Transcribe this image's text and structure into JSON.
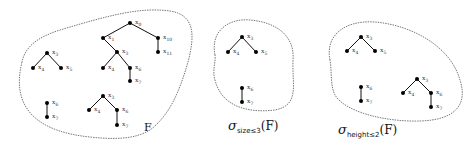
{
  "panels": [
    {
      "id": "F",
      "caption": "F",
      "blob": "M 22 62 C 10 110, 40 132, 90 137 C 125 141, 140 136, 150 130 C 170 115, 180 90, 188 62 C 195 35, 195 15, 170 11 C 140 7, 110 15, 60 30 C 35 38, 25 48, 22 62 Z",
      "caption_pos": [
        144,
        131
      ],
      "nodes": [
        {
          "id": "a0",
          "x": 130,
          "y": 23,
          "label": "x0"
        },
        {
          "id": "a1",
          "x": 103,
          "y": 38,
          "label": "x1"
        },
        {
          "id": "a10",
          "x": 158,
          "y": 38,
          "label": "x10"
        },
        {
          "id": "a11",
          "x": 158,
          "y": 52,
          "label": "x11"
        },
        {
          "id": "a3",
          "x": 117,
          "y": 52,
          "label": "x3"
        },
        {
          "id": "a4",
          "x": 103,
          "y": 68,
          "label": "x4"
        },
        {
          "id": "a6",
          "x": 130,
          "y": 68,
          "label": "x6"
        },
        {
          "id": "a7",
          "x": 130,
          "y": 81,
          "label": "x7"
        },
        {
          "id": "b3",
          "x": 47,
          "y": 53,
          "label": "x3"
        },
        {
          "id": "b4",
          "x": 33,
          "y": 68,
          "label": "x4"
        },
        {
          "id": "b5",
          "x": 61,
          "y": 68,
          "label": "x5"
        },
        {
          "id": "c6",
          "x": 47,
          "y": 103,
          "label": "x6"
        },
        {
          "id": "c7",
          "x": 47,
          "y": 117,
          "label": "x7"
        },
        {
          "id": "d3",
          "x": 103,
          "y": 96,
          "label": "x3"
        },
        {
          "id": "d4",
          "x": 89,
          "y": 110,
          "label": "x4"
        },
        {
          "id": "d6",
          "x": 117,
          "y": 110,
          "label": "x6"
        },
        {
          "id": "d7",
          "x": 117,
          "y": 125,
          "label": "x7"
        }
      ],
      "edges": [
        [
          "a0",
          "a1"
        ],
        [
          "a0",
          "a10"
        ],
        [
          "a10",
          "a11"
        ],
        [
          "a1",
          "a3"
        ],
        [
          "a3",
          "a4"
        ],
        [
          "a3",
          "a6"
        ],
        [
          "a6",
          "a7"
        ],
        [
          "b3",
          "b4"
        ],
        [
          "b3",
          "b5"
        ],
        [
          "c6",
          "c7"
        ],
        [
          "d3",
          "d4"
        ],
        [
          "d3",
          "d6"
        ],
        [
          "d6",
          "d7"
        ]
      ]
    },
    {
      "id": "size",
      "caption_main": "σ",
      "caption_sub": "size≤3",
      "caption_arg": "(F)",
      "blob": "M 215 55 C 210 30, 230 18, 250 20 C 275 22, 295 35, 293 60 C 292 85, 300 105, 275 110 C 250 113, 222 108, 215 80 C 212 70, 216 62, 215 55 Z",
      "caption_pos": [
        228,
        130
      ],
      "nodes": [
        {
          "id": "s3",
          "x": 242,
          "y": 37,
          "label": "x3"
        },
        {
          "id": "s4",
          "x": 228,
          "y": 52,
          "label": "x4"
        },
        {
          "id": "s5",
          "x": 256,
          "y": 52,
          "label": "x5"
        },
        {
          "id": "s6",
          "x": 242,
          "y": 88,
          "label": "x6"
        },
        {
          "id": "s7",
          "x": 242,
          "y": 102,
          "label": "x7"
        }
      ],
      "edges": [
        [
          "s3",
          "s4"
        ],
        [
          "s3",
          "s5"
        ],
        [
          "s6",
          "s7"
        ]
      ]
    },
    {
      "id": "height",
      "caption_main": "σ",
      "caption_sub": "height≤2",
      "caption_arg": "(F)",
      "blob": "M 330 60 C 325 35, 345 20, 375 22 C 410 25, 450 45, 460 80 C 468 105, 455 120, 420 121 C 385 122, 345 112, 335 95 C 330 85, 332 72, 330 60 Z",
      "caption_pos": [
        338,
        134
      ],
      "nodes": [
        {
          "id": "h3",
          "x": 361,
          "y": 37,
          "label": "x3"
        },
        {
          "id": "h4",
          "x": 347,
          "y": 51,
          "label": "x4"
        },
        {
          "id": "h5",
          "x": 375,
          "y": 51,
          "label": "x5"
        },
        {
          "id": "h6",
          "x": 361,
          "y": 87,
          "label": "x6"
        },
        {
          "id": "h7",
          "x": 361,
          "y": 101,
          "label": "x7"
        },
        {
          "id": "g3",
          "x": 417,
          "y": 79,
          "label": "x3"
        },
        {
          "id": "g4",
          "x": 403,
          "y": 93,
          "label": "x4"
        },
        {
          "id": "g6",
          "x": 431,
          "y": 93,
          "label": "x6"
        },
        {
          "id": "g7",
          "x": 431,
          "y": 107,
          "label": "x7"
        }
      ],
      "edges": [
        [
          "h3",
          "h4"
        ],
        [
          "h3",
          "h5"
        ],
        [
          "h6",
          "h7"
        ],
        [
          "g3",
          "g4"
        ],
        [
          "g3",
          "g6"
        ],
        [
          "g6",
          "g7"
        ]
      ]
    }
  ]
}
